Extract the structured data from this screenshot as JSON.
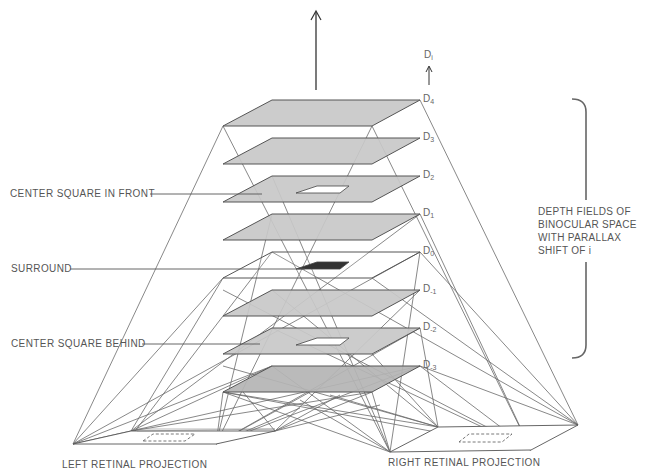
{
  "labels": {
    "center_square_in_front": "CENTER SQUARE IN FRONT",
    "surround": "SURROUND",
    "center_square_behind": "CENTER SQUARE BEHIND",
    "left_retinal_projection": "LEFT RETINAL PROJECTION",
    "right_retinal_projection": "RIGHT RETINAL PROJECTION",
    "bracket_text": [
      "DEPTH FIELDS OF",
      "BINOCULAR SPACE",
      "WITH PARALLAX",
      "SHIFT OF i"
    ],
    "axis_label_base": "D",
    "axis_label_sub": "i"
  },
  "depth_planes": [
    {
      "base": "D",
      "sub": "4",
      "fill": "shaded",
      "center": "none"
    },
    {
      "base": "D",
      "sub": "3",
      "fill": "shaded",
      "center": "none"
    },
    {
      "base": "D",
      "sub": "2",
      "fill": "shaded",
      "center": "hole"
    },
    {
      "base": "D",
      "sub": "1",
      "fill": "shaded",
      "center": "none"
    },
    {
      "base": "D",
      "sub": "0",
      "fill": "clear",
      "center": "dark"
    },
    {
      "base": "D",
      "sub": "-1",
      "fill": "shaded",
      "center": "none"
    },
    {
      "base": "D",
      "sub": "-2",
      "fill": "shaded",
      "center": "hole"
    },
    {
      "base": "D",
      "sub": "-3",
      "fill": "shaded-dark",
      "center": "none"
    }
  ],
  "colors": {
    "plane_fill": "#c8c8c8",
    "plane_fill_dark": "#b4b4b4",
    "plane_edge": "#555555",
    "line": "#6a6a6a",
    "dark_square": "#333333",
    "text": "#555555"
  }
}
